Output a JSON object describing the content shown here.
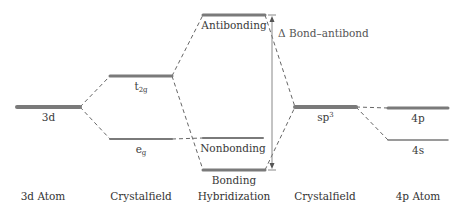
{
  "diagram": {
    "title": "",
    "colors": {
      "level": "#7a7a7a",
      "dash": "#666666",
      "arrow": "#888888",
      "text": "#333333"
    },
    "columns": [
      {
        "id": "atom3d",
        "label": "3d Atom",
        "x": 43
      },
      {
        "id": "cf1",
        "label": "Crystalfield",
        "x": 141
      },
      {
        "id": "hyb",
        "label": "Hybridization",
        "x": 234
      },
      {
        "id": "cf2",
        "label": "Crystalfield",
        "x": 325
      },
      {
        "id": "atom4p",
        "label": "4p Atom",
        "x": 418
      }
    ],
    "levels": [
      {
        "id": "3d",
        "label_main": "3d",
        "label_sub": "",
        "label_sup": "",
        "x1": 17,
        "x2": 80,
        "y": 107,
        "w": 4
      },
      {
        "id": "t2g",
        "label_main": "t",
        "label_sub": "2g",
        "label_sup": "",
        "x1": 110,
        "x2": 172,
        "y": 76,
        "w": 3
      },
      {
        "id": "eg",
        "label_main": "e",
        "label_sub": "g",
        "label_sup": "",
        "x1": 110,
        "x2": 172,
        "y": 139,
        "w": 2
      },
      {
        "id": "antibonding",
        "label_main": "Antibonding",
        "label_sub": "",
        "label_sup": "",
        "x1": 203,
        "x2": 265,
        "y": 15,
        "w": 3
      },
      {
        "id": "nonbonding",
        "label_main": "Nonbonding",
        "label_sub": "",
        "label_sup": "",
        "x1": 203,
        "x2": 263,
        "y": 138,
        "w": 2
      },
      {
        "id": "bonding",
        "label_main": "Bonding",
        "label_sub": "",
        "label_sup": "",
        "x1": 203,
        "x2": 265,
        "y": 170,
        "w": 3
      },
      {
        "id": "sp3",
        "label_main": "sp",
        "label_sub": "",
        "label_sup": "3",
        "x1": 295,
        "x2": 356,
        "y": 107,
        "w": 4
      },
      {
        "id": "4p",
        "label_main": "4p",
        "label_sub": "",
        "label_sup": "",
        "x1": 388,
        "x2": 448,
        "y": 108,
        "w": 3
      },
      {
        "id": "4s",
        "label_main": "4s",
        "label_sub": "",
        "label_sup": "",
        "x1": 388,
        "x2": 448,
        "y": 140,
        "w": 1.5
      }
    ],
    "connectors": [
      {
        "from": [
          80,
          107
        ],
        "to": [
          110,
          76
        ]
      },
      {
        "from": [
          80,
          107
        ],
        "to": [
          110,
          139
        ]
      },
      {
        "from": [
          172,
          76
        ],
        "to": [
          203,
          15
        ]
      },
      {
        "from": [
          172,
          76
        ],
        "to": [
          203,
          170
        ]
      },
      {
        "from": [
          172,
          139
        ],
        "to": [
          203,
          138
        ]
      },
      {
        "from": [
          265,
          15
        ],
        "to": [
          295,
          107
        ]
      },
      {
        "from": [
          265,
          170
        ],
        "to": [
          295,
          107
        ]
      },
      {
        "from": [
          356,
          107
        ],
        "to": [
          388,
          108
        ]
      },
      {
        "from": [
          356,
          107
        ],
        "to": [
          388,
          140
        ]
      }
    ],
    "gap_arrow": {
      "x": 272,
      "y1": 15,
      "y2": 170,
      "label": "Δ Bond–antibond",
      "label_x": 278,
      "label_y": 28
    }
  }
}
